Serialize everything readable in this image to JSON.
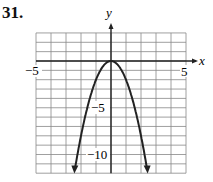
{
  "problem_number": "31.",
  "chart_data": {
    "type": "line",
    "title": "",
    "xlabel": "x",
    "ylabel": "y",
    "xlim": [
      -5,
      5
    ],
    "ylim": [
      -12,
      3
    ],
    "grid": true,
    "x_tick_labels": [
      "-5",
      "5"
    ],
    "y_tick_labels": [
      "-5",
      "-10"
    ],
    "series": [
      {
        "name": "y = -2x^2",
        "vertex": [
          0,
          0
        ],
        "x": [
          -2.45,
          -2,
          -1,
          0,
          1,
          2,
          2.45
        ],
        "y": [
          -12,
          -8,
          -2,
          0,
          -2,
          -8,
          -12
        ]
      }
    ]
  },
  "labels": {
    "x_axis": "x",
    "y_axis": "y",
    "xmin": "−5",
    "xmax": "5",
    "y5": "−5",
    "y10": "−10"
  }
}
